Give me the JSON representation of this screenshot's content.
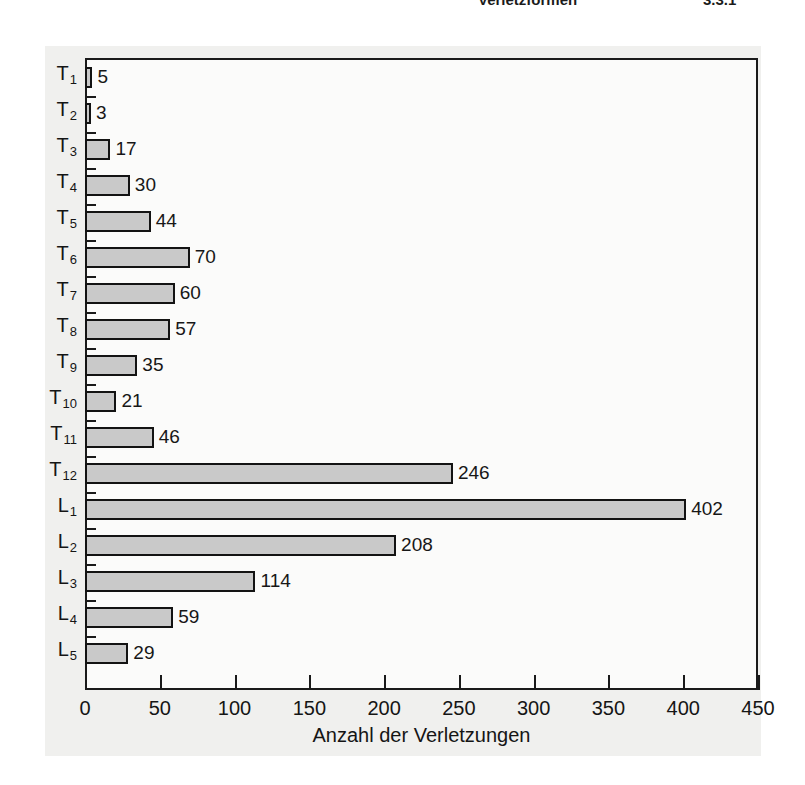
{
  "page_header": {
    "title": "Verletzformen",
    "number": "3.3.1"
  },
  "chart_data": {
    "type": "bar",
    "orientation": "horizontal",
    "title": "",
    "xlabel": "Anzahl der Verletzungen",
    "ylabel": "",
    "xlim": [
      0,
      450
    ],
    "xticks": [
      "0",
      "50",
      "100",
      "150",
      "200",
      "250",
      "300",
      "350",
      "400",
      "450"
    ],
    "xtick_values": [
      0,
      50,
      100,
      150,
      200,
      250,
      300,
      350,
      400,
      450
    ],
    "grid": false,
    "legend": null,
    "bar_color": "#c9c9c9",
    "bar_edge_color": "#131313",
    "categories": [
      "T1",
      "T2",
      "T3",
      "T4",
      "T5",
      "T6",
      "T7",
      "T8",
      "T9",
      "T10",
      "T11",
      "T12",
      "L1",
      "L2",
      "L3",
      "L4",
      "L5"
    ],
    "category_labels": [
      {
        "base": "T",
        "sub": "1"
      },
      {
        "base": "T",
        "sub": "2"
      },
      {
        "base": "T",
        "sub": "3"
      },
      {
        "base": "T",
        "sub": "4"
      },
      {
        "base": "T",
        "sub": "5"
      },
      {
        "base": "T",
        "sub": "6"
      },
      {
        "base": "T",
        "sub": "7"
      },
      {
        "base": "T",
        "sub": "8"
      },
      {
        "base": "T",
        "sub": "9"
      },
      {
        "base": "T",
        "sub": "10"
      },
      {
        "base": "T",
        "sub": "11"
      },
      {
        "base": "T",
        "sub": "12"
      },
      {
        "base": "L",
        "sub": "1"
      },
      {
        "base": "L",
        "sub": "2"
      },
      {
        "base": "L",
        "sub": "3"
      },
      {
        "base": "L",
        "sub": "4"
      },
      {
        "base": "L",
        "sub": "5"
      }
    ],
    "values": [
      5,
      3,
      17,
      30,
      44,
      70,
      60,
      57,
      35,
      21,
      46,
      246,
      402,
      208,
      114,
      59,
      29
    ],
    "value_labels": [
      "5",
      "3",
      "17",
      "30",
      "44",
      "70",
      "60",
      "57",
      "35",
      "21",
      "46",
      "246",
      "402",
      "208",
      "114",
      "59",
      "29"
    ]
  }
}
